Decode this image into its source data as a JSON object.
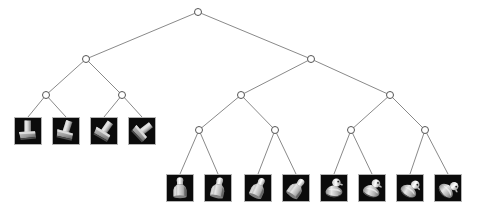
{
  "figure": {
    "type": "dendrogram",
    "title": "",
    "background_color": "#ffffff",
    "node_stroke_color": "#555555",
    "node_fill_color": "#ffffff",
    "edge_color": "#6b6b6b",
    "node_radius": 3.5,
    "thumb_border_color": "#b4b4b4",
    "thumb_background_color": "#0a0a0a",
    "thumb_size": 28
  },
  "tree": {
    "description": "Binary hierarchical clustering tree with 12 image leaves",
    "nodes": [
      {
        "id": "root",
        "label": "root",
        "x": 198,
        "y": 12,
        "level": 0
      },
      {
        "id": "n-l",
        "label": "n-l",
        "x": 86,
        "y": 59,
        "level": 1
      },
      {
        "id": "n-r",
        "label": "n-r",
        "x": 311,
        "y": 59,
        "level": 1
      },
      {
        "id": "n-ll",
        "label": "n-ll",
        "x": 46,
        "y": 95,
        "level": 2
      },
      {
        "id": "n-lr",
        "label": "n-lr",
        "x": 122,
        "y": 95,
        "level": 2
      },
      {
        "id": "n-rl",
        "label": "n-rl",
        "x": 241,
        "y": 95,
        "level": 2
      },
      {
        "id": "n-rr",
        "label": "n-rr",
        "x": 390,
        "y": 95,
        "level": 2
      },
      {
        "id": "n-rll",
        "label": "n-rll",
        "x": 199,
        "y": 130,
        "level": 3
      },
      {
        "id": "n-rlr",
        "label": "n-rlr",
        "x": 275,
        "y": 130,
        "level": 3
      },
      {
        "id": "n-rrl",
        "label": "n-rrl",
        "x": 351,
        "y": 130,
        "level": 3
      },
      {
        "id": "n-rrr",
        "label": "n-rrr",
        "x": 425,
        "y": 130,
        "level": 3
      }
    ],
    "edges": [
      {
        "from": "root",
        "to": "n-l"
      },
      {
        "from": "root",
        "to": "n-r"
      },
      {
        "from": "n-l",
        "to": "n-ll"
      },
      {
        "from": "n-l",
        "to": "n-lr"
      },
      {
        "from": "n-r",
        "to": "n-rl"
      },
      {
        "from": "n-r",
        "to": "n-rr"
      },
      {
        "from": "n-rl",
        "to": "n-rll"
      },
      {
        "from": "n-rl",
        "to": "n-rlr"
      },
      {
        "from": "n-rr",
        "to": "n-rrl"
      },
      {
        "from": "n-rr",
        "to": "n-rrr"
      },
      {
        "from": "n-ll",
        "to": "leaf-1"
      },
      {
        "from": "n-ll",
        "to": "leaf-2"
      },
      {
        "from": "n-lr",
        "to": "leaf-3"
      },
      {
        "from": "n-lr",
        "to": "leaf-4"
      },
      {
        "from": "n-rll",
        "to": "leaf-5"
      },
      {
        "from": "n-rll",
        "to": "leaf-6"
      },
      {
        "from": "n-rlr",
        "to": "leaf-7"
      },
      {
        "from": "n-rlr",
        "to": "leaf-8"
      },
      {
        "from": "n-rrl",
        "to": "leaf-9"
      },
      {
        "from": "n-rrl",
        "to": "leaf-10"
      },
      {
        "from": "n-rrr",
        "to": "leaf-11"
      },
      {
        "from": "n-rrr",
        "to": "leaf-12"
      }
    ],
    "leaves": [
      {
        "id": "leaf-1",
        "label": "bracket-object-1",
        "object": "bracket",
        "x": 14,
        "y": 117,
        "anchor_x": 28,
        "anchor_y": 117,
        "rotation": 0
      },
      {
        "id": "leaf-2",
        "label": "bracket-object-2",
        "object": "bracket",
        "x": 52,
        "y": 117,
        "anchor_x": 66,
        "anchor_y": 117,
        "rotation": 18
      },
      {
        "id": "leaf-3",
        "label": "bracket-object-3",
        "object": "bracket",
        "x": 90,
        "y": 117,
        "anchor_x": 104,
        "anchor_y": 117,
        "rotation": 35
      },
      {
        "id": "leaf-4",
        "label": "bracket-object-4",
        "object": "bracket",
        "x": 128,
        "y": 117,
        "anchor_x": 142,
        "anchor_y": 117,
        "rotation": 52
      },
      {
        "id": "leaf-5",
        "label": "bottle-object-1",
        "object": "bottle",
        "x": 166,
        "y": 174,
        "anchor_x": 180,
        "anchor_y": 174,
        "rotation": 0
      },
      {
        "id": "leaf-6",
        "label": "bottle-object-2",
        "object": "bottle",
        "x": 204,
        "y": 174,
        "anchor_x": 218,
        "anchor_y": 174,
        "rotation": 12
      },
      {
        "id": "leaf-7",
        "label": "bottle-object-3",
        "object": "bottle",
        "x": 244,
        "y": 174,
        "anchor_x": 258,
        "anchor_y": 174,
        "rotation": 24
      },
      {
        "id": "leaf-8",
        "label": "bottle-object-4",
        "object": "bottle",
        "x": 282,
        "y": 174,
        "anchor_x": 296,
        "anchor_y": 174,
        "rotation": 36
      },
      {
        "id": "leaf-9",
        "label": "duck-object-1",
        "object": "duck",
        "x": 320,
        "y": 174,
        "anchor_x": 334,
        "anchor_y": 174,
        "rotation": 0
      },
      {
        "id": "leaf-10",
        "label": "duck-object-2",
        "object": "duck",
        "x": 358,
        "y": 174,
        "anchor_x": 372,
        "anchor_y": 174,
        "rotation": 15
      },
      {
        "id": "leaf-11",
        "label": "duck-object-3",
        "object": "duck",
        "x": 396,
        "y": 174,
        "anchor_x": 410,
        "anchor_y": 174,
        "rotation": 30
      },
      {
        "id": "leaf-12",
        "label": "duck-object-4",
        "object": "duck",
        "x": 434,
        "y": 174,
        "anchor_x": 448,
        "anchor_y": 174,
        "rotation": 45
      }
    ]
  }
}
